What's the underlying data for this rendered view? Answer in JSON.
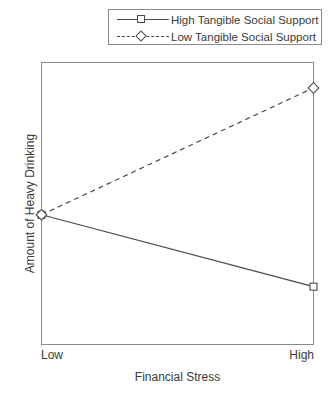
{
  "chart_data": {
    "type": "line",
    "title": "",
    "xlabel": "Financial Stress",
    "ylabel": "Amount of Heavy Drinking",
    "categories": [
      "Low",
      "High"
    ],
    "xticklabels": [
      "Low",
      "High"
    ],
    "yticklabels": [],
    "xlim": [
      0,
      1
    ],
    "ylim": [
      0,
      1
    ],
    "grid": false,
    "legend_position": "top",
    "series": [
      {
        "name": "High Tangible Social Support",
        "marker": "square",
        "linestyle": "solid",
        "color": "#4a4a4a",
        "x": [
          0,
          1
        ],
        "values": [
          0.46,
          0.205
        ]
      },
      {
        "name": "Low Tangible Social Support",
        "marker": "diamond",
        "linestyle": "dashed",
        "color": "#4a4a4a",
        "x": [
          0,
          1
        ],
        "values": [
          0.46,
          0.91
        ]
      }
    ]
  },
  "legend": {
    "entries": [
      {
        "label": "High Tangible Social Support"
      },
      {
        "label": "Low Tangible Social Support"
      }
    ]
  },
  "axes": {
    "x_title": "Financial Stress",
    "y_title": "Amount of Heavy Drinking",
    "x_tick_low": "Low",
    "x_tick_high": "High"
  }
}
